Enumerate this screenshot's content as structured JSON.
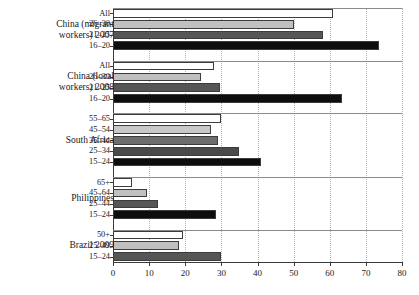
{
  "chart_data": {
    "type": "bar",
    "orientation": "horizontal",
    "title": "",
    "xlabel": "",
    "ylabel": "",
    "xlim": [
      0,
      80
    ],
    "xticks": [
      0,
      10,
      20,
      30,
      40,
      50,
      60,
      70,
      80
    ],
    "grid": "vertical dotted gridlines at each x tick",
    "legend": "none",
    "groups": [
      {
        "name": "China (migrant\nworkers) 2007",
        "categories": [
          "All",
          "26–30",
          "21–25",
          "16–20"
        ],
        "values": [
          61,
          50,
          58,
          73.5
        ],
        "fills": [
          "#ffffff",
          "#c0c0c0",
          "#565656",
          "#0d0d0d"
        ]
      },
      {
        "name": "China (local\nworkers) 2008",
        "categories": [
          "All",
          "26–30",
          "21–25",
          "16–20"
        ],
        "values": [
          28,
          24.3,
          29.6,
          63.5
        ],
        "fills": [
          "#ffffff",
          "#c0c0c0",
          "#565656",
          "#0d0d0d"
        ]
      },
      {
        "name": "South Africa",
        "categories": [
          "55–65",
          "45–54",
          "35–44",
          "25–34",
          "15–24"
        ],
        "values": [
          30,
          27,
          29,
          35,
          41
        ],
        "fills": [
          "#ffffff",
          "#c8c8c8",
          "#6e6e6e",
          "#4a4a4a",
          "#0d0d0d"
        ]
      },
      {
        "name": "Philippines",
        "categories": [
          "65+",
          "45–64",
          "25–44",
          "15–24"
        ],
        "values": [
          5.3,
          9.4,
          12.5,
          28.5
        ],
        "fills": [
          "#ffffff",
          "#c0c0c0",
          "#565656",
          "#0d0d0d"
        ]
      },
      {
        "name": "Brazil 2009",
        "categories": [
          "50+",
          "25–49",
          "15–24"
        ],
        "values": [
          19.4,
          18.2,
          30
        ],
        "fills": [
          "#ffffff",
          "#c0c0c0",
          "#565656"
        ]
      }
    ]
  },
  "axis": {
    "tick_labels": [
      "0",
      "10",
      "20",
      "30",
      "40",
      "50",
      "60",
      "70",
      "80"
    ]
  }
}
